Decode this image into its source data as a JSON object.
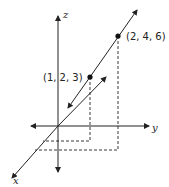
{
  "diagram": {
    "axes": {
      "x_label": "x",
      "y_label": "y",
      "z_label": "z"
    },
    "points": [
      {
        "label": "(1, 2, 3)",
        "coords": [
          1,
          2,
          3
        ]
      },
      {
        "label": "(2, 4, 6)",
        "coords": [
          2,
          4,
          6
        ]
      }
    ],
    "colors": {
      "line": "#222222",
      "background": "#ffffff"
    }
  }
}
